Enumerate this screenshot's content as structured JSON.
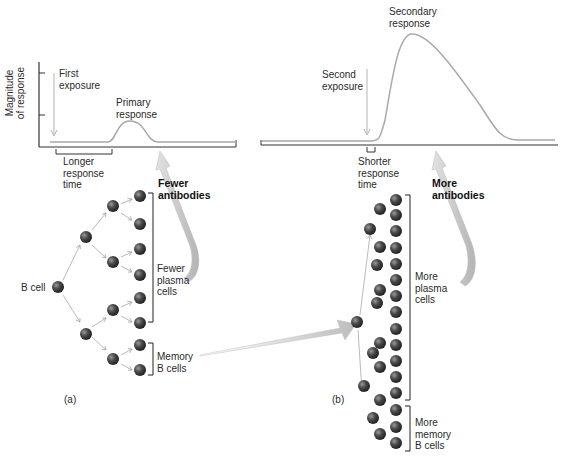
{
  "panel_a": {
    "graph": {
      "y_axis_label": "Magnitude\nof response",
      "exposure_label": "First\nexposure",
      "response_label": "Primary\nresponse",
      "response_time_label": "Longer\nresponse\ntime"
    },
    "antibodies_label": "Fewer\nantibodies",
    "b_cell_label": "B cell",
    "plasma_cells_label": "Fewer\nplasma\ncells",
    "memory_cells_label": "Memory\nB cells",
    "panel_label": "(a)",
    "plasma_cell_count": 6,
    "memory_cell_count": 2
  },
  "panel_b": {
    "graph": {
      "exposure_label": "Second\nexposure",
      "response_label": "Secondary\nresponse",
      "response_time_label": "Shorter\nresponse\ntime"
    },
    "antibodies_label": "More\nantibodies",
    "plasma_cells_label": "More\nplasma\ncells",
    "memory_cells_label": "More\nmemory\nB cells",
    "panel_label": "(b)",
    "plasma_cell_count": 16,
    "memory_cell_count": 4
  },
  "colors": {
    "cell": "#3a3a3a",
    "cell_highlight": "#9a9a9a",
    "curve": "#a8a8a8",
    "axis": "#333333",
    "arrow_fill": "#c8c8c8"
  }
}
